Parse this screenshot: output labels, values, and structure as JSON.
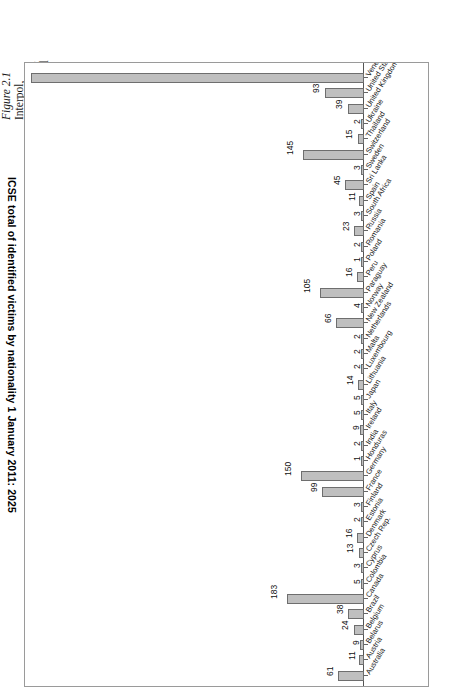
{
  "caption": {
    "figure_number": "Figure 2.1",
    "lines": [
      "Interpol,",
      "International",
      "Child Sexual",
      "Exploitation",
      "Image Data",
      "(ICSE) total",
      "identified vi",
      "in abusive s",
      "images by",
      "nationality"
    ]
  },
  "chart_data": {
    "type": "bar",
    "orientation": "horizontal",
    "title": "ICSE total of identified victims by nationality 1 January 2011: 2025",
    "xlabel": "",
    "ylabel": "",
    "grid": false,
    "legend": "none",
    "xlim": [
      0,
      790
    ],
    "categories": [
      "Australia",
      "Austria",
      "Belarus",
      "Belgium",
      "Brazil",
      "Canada",
      "Colombia",
      "Cyprus",
      "Czech Rep.",
      "Denmark",
      "Estonia",
      "Finland",
      "France",
      "Germany",
      "Honduras",
      "India",
      "Ireland",
      "Italy",
      "Japan",
      "Lithuania",
      "Luxembourg",
      "Malta",
      "Netherlands",
      "New Zealand",
      "Norway",
      "Paraguay",
      "Peru",
      "Poland",
      "Romania",
      "Russia",
      "South Africa",
      "Spain",
      "Sri Lanka",
      "Sweden",
      "Switzerland",
      "Thailand",
      "Ukraine",
      "United Kingdom",
      "United States",
      "Venezuela"
    ],
    "values": [
      61,
      11,
      9,
      24,
      38,
      183,
      5,
      3,
      13,
      16,
      2,
      3,
      99,
      150,
      1,
      2,
      9,
      5,
      5,
      14,
      2,
      2,
      2,
      66,
      4,
      105,
      16,
      1,
      2,
      23,
      3,
      11,
      45,
      3,
      145,
      15,
      2,
      39,
      93,
      790
    ],
    "bar_color": "#bfbfbf",
    "bar_border_color": "#6e6e6e"
  }
}
